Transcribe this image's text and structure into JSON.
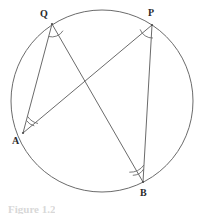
{
  "figure": {
    "caption": "Figure 1.2",
    "background_color": "#ffffff",
    "stroke_color": "#6b6b6b",
    "label_color": "#2b2b2b",
    "canvas": {
      "width": 201,
      "height": 215
    }
  },
  "circle": {
    "name": "circumscribed-circle",
    "cx": 102,
    "cy": 101,
    "r": 91,
    "stroke": "#6b6b6b",
    "stroke_width": 1
  },
  "points": [
    {
      "id": "Q",
      "label": "Q",
      "x": 52,
      "y": 24,
      "label_x": 40,
      "label_y": 9,
      "arc_count": 1
    },
    {
      "id": "P",
      "label": "P",
      "x": 152,
      "y": 25,
      "label_x": 148,
      "label_y": 8,
      "arc_count": 1
    },
    {
      "id": "A",
      "label": "A",
      "x": 23,
      "y": 133,
      "label_x": 12,
      "label_y": 136,
      "arc_count": 2
    },
    {
      "id": "B",
      "label": "B",
      "x": 143,
      "y": 182,
      "label_x": 140,
      "label_y": 188,
      "arc_count": 2
    }
  ],
  "chords": [
    {
      "id": "QA",
      "from": "Q",
      "to": "A",
      "x1": 52,
      "y1": 24,
      "x2": 23,
      "y2": 133
    },
    {
      "id": "QB",
      "from": "Q",
      "to": "B",
      "x1": 52,
      "y1": 24,
      "x2": 143,
      "y2": 182
    },
    {
      "id": "PA",
      "from": "P",
      "to": "A",
      "x1": 152,
      "y1": 25,
      "x2": 23,
      "y2": 133
    },
    {
      "id": "PB",
      "from": "P",
      "to": "B",
      "x1": 152,
      "y1": 25,
      "x2": 143,
      "y2": 182
    }
  ],
  "intersection": {
    "id": "QB-PA-crossing",
    "x": 85,
    "y": 90
  },
  "angle_marks": [
    {
      "vertex": "Q",
      "arcs": 1,
      "radii": [
        13
      ]
    },
    {
      "vertex": "P",
      "arcs": 1,
      "radii": [
        13
      ]
    },
    {
      "vertex": "A",
      "arcs": 2,
      "radii": [
        13,
        17
      ]
    },
    {
      "vertex": "B",
      "arcs": 2,
      "radii": [
        13,
        17
      ]
    }
  ]
}
